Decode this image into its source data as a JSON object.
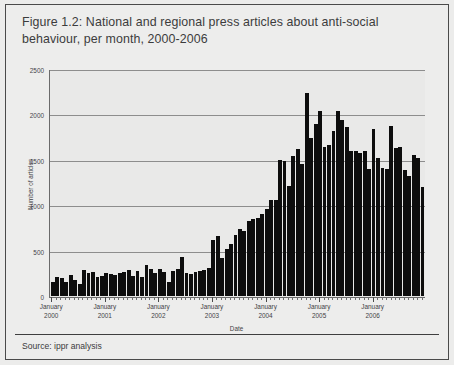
{
  "figure": {
    "title": "Figure 1.2: National and regional press articles about anti-social behaviour, per month, 2000-2006",
    "source": "Source: ippr analysis"
  },
  "chart_data": {
    "type": "bar",
    "title": "Figure 1.2: National and regional press articles about anti-social behaviour, per month, 2000-2006",
    "xlabel": "Date",
    "ylabel": "Number of articles",
    "ylim": [
      0,
      2500
    ],
    "yticks": [
      0,
      500,
      1000,
      1500,
      2000,
      2500
    ],
    "grid": true,
    "legend": false,
    "bar_color": "#0d0d0d",
    "plot_background": "#e9e9e8",
    "major_tick_labels": [
      "January\n2000",
      "January\n2001",
      "January\n2002",
      "January\n2003",
      "January\n2004",
      "January\n2005",
      "January\n2006"
    ],
    "major_tick_lines": [
      "January",
      "January",
      "January",
      "January",
      "January",
      "January",
      "January"
    ],
    "major_tick_years": [
      "2000",
      "2001",
      "2002",
      "2003",
      "2004",
      "2005",
      "2006"
    ],
    "categories": [
      "Jan 2000",
      "Feb 2000",
      "Mar 2000",
      "Apr 2000",
      "May 2000",
      "Jun 2000",
      "Jul 2000",
      "Aug 2000",
      "Sep 2000",
      "Oct 2000",
      "Nov 2000",
      "Dec 2000",
      "Jan 2001",
      "Feb 2001",
      "Mar 2001",
      "Apr 2001",
      "May 2001",
      "Jun 2001",
      "Jul 2001",
      "Aug 2001",
      "Sep 2001",
      "Oct 2001",
      "Nov 2001",
      "Dec 2001",
      "Jan 2002",
      "Feb 2002",
      "Mar 2002",
      "Apr 2002",
      "May 2002",
      "Jun 2002",
      "Jul 2002",
      "Aug 2002",
      "Sep 2002",
      "Oct 2002",
      "Nov 2002",
      "Dec 2002",
      "Jan 2003",
      "Feb 2003",
      "Mar 2003",
      "Apr 2003",
      "May 2003",
      "Jun 2003",
      "Jul 2003",
      "Aug 2003",
      "Sep 2003",
      "Oct 2003",
      "Nov 2003",
      "Dec 2003",
      "Jan 2004",
      "Feb 2004",
      "Mar 2004",
      "Apr 2004",
      "May 2004",
      "Jun 2004",
      "Jul 2004",
      "Aug 2004",
      "Sep 2004",
      "Oct 2004",
      "Nov 2004",
      "Dec 2004",
      "Jan 2005",
      "Feb 2005",
      "Mar 2005",
      "Apr 2005",
      "May 2005",
      "Jun 2005",
      "Jul 2005",
      "Aug 2005",
      "Sep 2005",
      "Oct 2005",
      "Nov 2005",
      "Dec 2005",
      "Jan 2006",
      "Feb 2006",
      "Mar 2006",
      "Apr 2006",
      "May 2006",
      "Jun 2006",
      "Jul 2006",
      "Aug 2006",
      "Sep 2006",
      "Oct 2006",
      "Nov 2006",
      "Dec 2006"
    ],
    "values": [
      150,
      215,
      195,
      150,
      235,
      175,
      130,
      290,
      250,
      265,
      215,
      225,
      250,
      240,
      230,
      250,
      265,
      285,
      225,
      280,
      205,
      345,
      300,
      260,
      300,
      265,
      160,
      280,
      300,
      430,
      250,
      245,
      265,
      275,
      290,
      305,
      620,
      665,
      420,
      520,
      570,
      675,
      740,
      720,
      830,
      855,
      865,
      905,
      960,
      1060,
      1060,
      1500,
      1490,
      1220,
      1545,
      1625,
      1460,
      2250,
      1745,
      1905,
      2050,
      1650,
      1670,
      1830,
      2050,
      1950,
      1870,
      1600,
      1600,
      1580,
      1605,
      1400,
      1845,
      1530,
      1420,
      1410,
      1880,
      1640,
      1650,
      1390,
      1330,
      1560,
      1525,
      1210
    ]
  }
}
